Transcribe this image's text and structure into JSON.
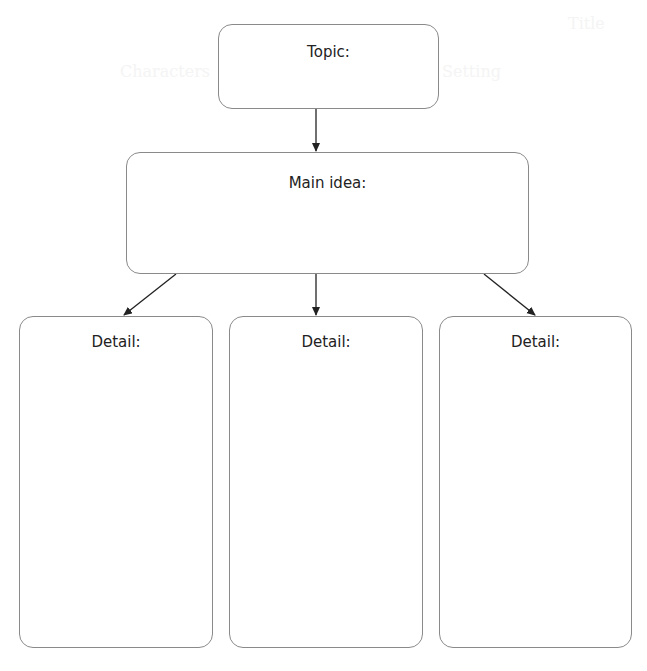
{
  "organizer": {
    "type": "main-idea-and-details graphic organizer",
    "border_color": "#8a8a8a",
    "arrow_color": "#222222",
    "topic": {
      "label": "Topic:",
      "value": ""
    },
    "main_idea": {
      "label": "Main idea:",
      "value": ""
    },
    "details": [
      {
        "label": "Detail:",
        "value": ""
      },
      {
        "label": "Detail:",
        "value": ""
      },
      {
        "label": "Detail:",
        "value": ""
      }
    ]
  },
  "background_ghost_text": {
    "title": "Title",
    "setting": "Setting",
    "characters": "Characters"
  }
}
